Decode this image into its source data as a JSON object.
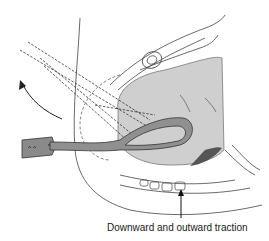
{
  "figure": {
    "caption": "Downward and outward traction",
    "colors": {
      "line": "#2a2a2a",
      "head_fill": "#c8c8c8",
      "forceps_fill": "#8c8c8c",
      "background": "#ffffff"
    }
  }
}
